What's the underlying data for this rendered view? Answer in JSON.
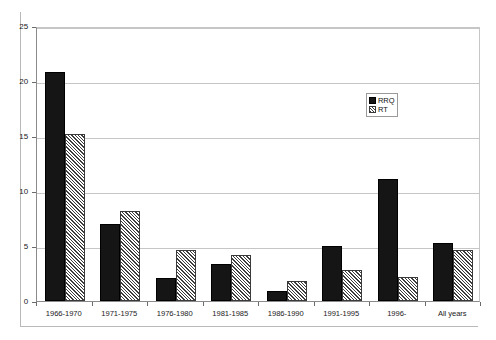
{
  "chart_data": {
    "type": "bar",
    "title": "",
    "subtitle": "",
    "xlabel": "",
    "ylabel": "",
    "ylim": [
      0,
      25
    ],
    "yticks": [
      0,
      5,
      10,
      15,
      20,
      25
    ],
    "grid": true,
    "legend_position": "inside-upper-right",
    "categories": [
      "1966-1970",
      "1971-1975",
      "1976-1980",
      "1981-1985",
      "1986-1990",
      "1991-1995",
      "1996-",
      "All years"
    ],
    "series": [
      {
        "name": "RRQ",
        "fill": "solid-black",
        "color": "#151515",
        "values": [
          20.8,
          7.0,
          2.1,
          3.4,
          0.9,
          5.0,
          11.1,
          5.3
        ]
      },
      {
        "name": "RT",
        "fill": "diagonal-hatch",
        "color": "#3d3d3d",
        "values": [
          15.2,
          8.2,
          4.6,
          4.2,
          1.8,
          2.8,
          2.2,
          4.6
        ]
      }
    ]
  },
  "legend": {
    "items": [
      {
        "label": "RRQ"
      },
      {
        "label": "RT"
      }
    ]
  }
}
